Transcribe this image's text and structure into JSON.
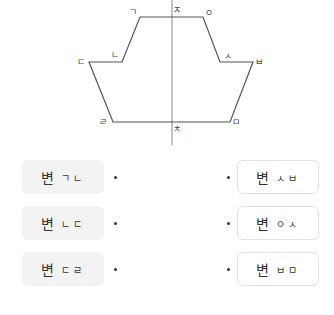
{
  "diagram": {
    "vertices": [
      {
        "id": "g",
        "label": "ㄱ",
        "x": 140,
        "y": 17,
        "lx": 133,
        "ly": 12
      },
      {
        "id": "j",
        "label": "ㅈ",
        "x": 172,
        "y": 17,
        "lx": 177,
        "ly": 10
      },
      {
        "id": "o",
        "label": "ㅇ",
        "x": 203,
        "y": 17,
        "lx": 209,
        "ly": 13
      },
      {
        "id": "n",
        "label": "ㄴ",
        "x": 122,
        "y": 62,
        "lx": 115,
        "ly": 55
      },
      {
        "id": "d",
        "label": "ㄷ",
        "x": 89,
        "y": 62,
        "lx": 81,
        "ly": 62
      },
      {
        "id": "s",
        "label": "ㅅ",
        "x": 220,
        "y": 62,
        "lx": 228,
        "ly": 56
      },
      {
        "id": "b",
        "label": "ㅂ",
        "x": 253,
        "y": 62,
        "lx": 259,
        "ly": 62
      },
      {
        "id": "r",
        "label": "ㄹ",
        "x": 113,
        "y": 122,
        "lx": 103,
        "ly": 122
      },
      {
        "id": "m",
        "label": "ㅁ",
        "x": 230,
        "y": 122,
        "lx": 236,
        "ly": 122
      },
      {
        "id": "ch",
        "label": "ㅊ",
        "x": 172,
        "y": 122,
        "lx": 177,
        "ly": 129
      }
    ],
    "axis_color": "#888888",
    "line_color": "#555555"
  },
  "matching": {
    "left": [
      {
        "word": "변",
        "jamo": "ㄱㄴ"
      },
      {
        "word": "변",
        "jamo": "ㄴㄷ"
      },
      {
        "word": "변",
        "jamo": "ㄷㄹ"
      }
    ],
    "right": [
      {
        "word": "변",
        "jamo": "ㅅㅂ"
      },
      {
        "word": "변",
        "jamo": "ㅇㅅ"
      },
      {
        "word": "변",
        "jamo": "ㅂㅁ"
      }
    ]
  }
}
